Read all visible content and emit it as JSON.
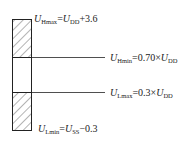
{
  "diagram": {
    "labels": {
      "h_max": {
        "sym": "U",
        "sub": "Hmax",
        "eq": "=",
        "rhs_sym": "U",
        "rhs_sub": "DD",
        "rhs_tail": "+3.6"
      },
      "h_min": {
        "sym": "U",
        "sub": "Hmin",
        "eq": "=0.70×",
        "rhs_sym": "U",
        "rhs_sub": "DD",
        "rhs_tail": ""
      },
      "l_max": {
        "sym": "U",
        "sub": "Lmax",
        "eq": "=0.3×",
        "rhs_sym": "U",
        "rhs_sub": "DD",
        "rhs_tail": ""
      },
      "l_min": {
        "sym": "U",
        "sub": "Lmin",
        "eq": "=",
        "rhs_sym": "U",
        "rhs_sub": "SS",
        "rhs_tail": "−0.3"
      }
    },
    "regions": [
      {
        "name": "high-level-region",
        "pattern": "hatched"
      },
      {
        "name": "undefined-region",
        "pattern": "blank"
      },
      {
        "name": "low-level-region",
        "pattern": "hatched"
      }
    ],
    "colors": {
      "stroke": "#222222",
      "hatch": "#444444",
      "background": "#ffffff"
    }
  }
}
